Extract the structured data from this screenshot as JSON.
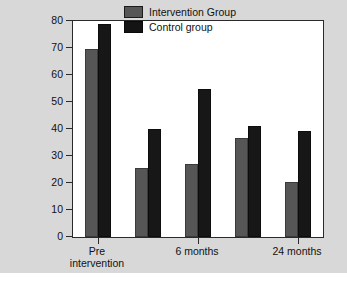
{
  "chart_data": {
    "type": "bar",
    "title": "",
    "xlabel": "",
    "ylabel": "Percent with anxiety disorder",
    "ylim": [
      0,
      80
    ],
    "ytick_values": [
      0,
      10,
      20,
      30,
      40,
      50,
      60,
      70,
      80
    ],
    "ytick_labels": [
      "0",
      "10",
      "20",
      "30",
      "40",
      "50",
      "60",
      "70",
      "80"
    ],
    "grid": false,
    "legend_position": "top-right",
    "categories": [
      "Pre intervention",
      "",
      "6 months",
      "",
      "24 months"
    ],
    "xtick_labels": [
      {
        "line1": "Pre",
        "line2": "intervention"
      },
      {
        "line1": "6 months",
        "line2": ""
      },
      {
        "line1": "24 months",
        "line2": ""
      }
    ],
    "xtick_category_index": [
      0,
      2,
      4
    ],
    "series": [
      {
        "name": "Intervention Group",
        "color": "#565656",
        "values": [
          69.5,
          25.5,
          27.0,
          36.5,
          20.3
        ]
      },
      {
        "name": "Control group",
        "color": "#171717",
        "values": [
          79.0,
          40.0,
          55.0,
          41.2,
          39.3
        ]
      }
    ]
  },
  "legend": {
    "entries": [
      {
        "label": "Intervention Group"
      },
      {
        "label": "Control group"
      }
    ]
  }
}
